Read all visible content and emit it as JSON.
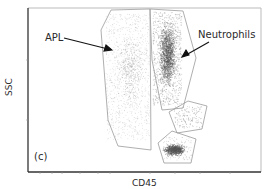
{
  "figure": {
    "panel_label": "(c)",
    "x_axis_label": "CD45",
    "y_axis_label": "SSC",
    "annotations": [
      {
        "text": "APL",
        "target": "APL gate population"
      },
      {
        "text": "Neutrophils",
        "target": "Neutrophil gate population"
      }
    ],
    "gates": [
      {
        "name": "APL",
        "description": "large faint diffuse population, mid CD45, wide SSC range"
      },
      {
        "name": "Neutrophils",
        "description": "dense population, higher CD45, high SSC"
      },
      {
        "name": "Monocytes",
        "description": "small sparse cluster, higher CD45, mid-low SSC"
      },
      {
        "name": "Lymphocytes",
        "description": "dense compact cluster, highest CD45, low SSC"
      }
    ],
    "colors": {
      "frame": "#333333",
      "gate_outline": "#9a9a9a",
      "dots": "#555555",
      "text": "#2a2a2a"
    }
  }
}
